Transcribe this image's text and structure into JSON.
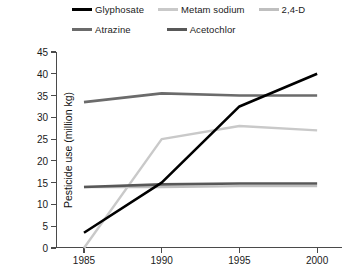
{
  "chart_data": {
    "type": "line",
    "title": "",
    "xlabel": "",
    "ylabel": "Pesticide use (million kg)",
    "x": [
      1985,
      1990,
      1995,
      2000
    ],
    "xtick_labels": [
      "1985",
      "1990",
      "1995",
      "2000"
    ],
    "xlim": [
      1983.2,
      2001.6
    ],
    "ylim": [
      0,
      45
    ],
    "ytick_labels": [
      "0",
      "5",
      "10",
      "15",
      "20",
      "25",
      "30",
      "35",
      "40",
      "45"
    ],
    "ytick_values": [
      0,
      5,
      10,
      15,
      20,
      25,
      30,
      35,
      40,
      45
    ],
    "grid": false,
    "legend_position": "top",
    "series": [
      {
        "name": "Glyphosate",
        "color": "#000000",
        "width": 2.6,
        "values": [
          3.5,
          15.0,
          32.5,
          40.0
        ]
      },
      {
        "name": "Metam sodium",
        "color": "#c9c9c9",
        "width": 2.4,
        "values": [
          0.0,
          25.0,
          28.0,
          27.0
        ]
      },
      {
        "name": "2,4-D",
        "color": "#bfbfbf",
        "width": 2.4,
        "values": [
          14.0,
          14.0,
          14.2,
          14.2
        ]
      },
      {
        "name": "Atrazine",
        "color": "#6b6b6b",
        "width": 2.6,
        "values": [
          33.5,
          35.5,
          35.0,
          35.0
        ]
      },
      {
        "name": "Acetochlor",
        "color": "#585858",
        "width": 2.6,
        "values": [
          14.0,
          14.6,
          14.8,
          14.8
        ]
      }
    ]
  },
  "legend": {
    "row1": [
      {
        "label": "Glyphosate",
        "color": "#000000"
      },
      {
        "label": "Metam sodium",
        "color": "#c9c9c9"
      },
      {
        "label": "2,4-D",
        "color": "#bfbfbf"
      }
    ],
    "row2": [
      {
        "label": "Atrazine",
        "color": "#6b6b6b"
      },
      {
        "label": "Acetochlor",
        "color": "#585858"
      }
    ]
  }
}
